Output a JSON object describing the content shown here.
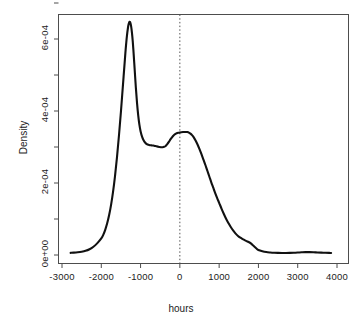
{
  "figure": {
    "background_color": "#ffffff",
    "line_color": "#111111",
    "axis_color": "#4d4d4d"
  },
  "chart_data": {
    "type": "line",
    "title": "",
    "subtitle": "",
    "xlabel": "hours",
    "ylabel": "Density",
    "xlim": [
      -3000,
      4000
    ],
    "ylim": [
      0,
      0.00072
    ],
    "grid": false,
    "legend": null,
    "x_ticks": [
      -3000,
      -2000,
      -1000,
      0,
      1000,
      2000,
      3000,
      4000
    ],
    "x_tick_labels": [
      "-3000",
      "-2000",
      "-1000",
      "0",
      "1000",
      "2000",
      "3000",
      "4000"
    ],
    "y_ticks": [
      0,
      0.0001,
      0.0002,
      0.0003,
      0.0004,
      0.0005,
      0.0006,
      0.0007
    ],
    "y_tick_labels": [
      "0e+00",
      "",
      "2e-04",
      "",
      "4e-04",
      "",
      "6e-04",
      ""
    ],
    "y_labeled_ticks": [
      {
        "value": 0,
        "label": "0e+00"
      },
      {
        "value": 0.0002,
        "label": "2e-04"
      },
      {
        "value": 0.0004,
        "label": "4e-04"
      },
      {
        "value": 0.0006,
        "label": "6e-04"
      }
    ],
    "annotations": [
      {
        "type": "vline",
        "x": 0,
        "style": "dotted",
        "color": "#555555"
      }
    ],
    "series": [
      {
        "name": "density",
        "x": [
          -2780,
          -2700,
          -2600,
          -2500,
          -2400,
          -2300,
          -2200,
          -2100,
          -2000,
          -1950,
          -1900,
          -1850,
          -1800,
          -1750,
          -1700,
          -1650,
          -1600,
          -1550,
          -1500,
          -1450,
          -1400,
          -1380,
          -1350,
          -1320,
          -1300,
          -1280,
          -1260,
          -1240,
          -1220,
          -1200,
          -1180,
          -1150,
          -1120,
          -1090,
          -1060,
          -1030,
          -1000,
          -960,
          -920,
          -880,
          -840,
          -800,
          -760,
          -720,
          -680,
          -640,
          -600,
          -560,
          -520,
          -480,
          -440,
          -400,
          -360,
          -320,
          -280,
          -240,
          -200,
          -160,
          -120,
          -80,
          -40,
          0,
          40,
          80,
          120,
          160,
          190,
          230,
          270,
          310,
          350,
          400,
          450,
          500,
          550,
          600,
          650,
          700,
          750,
          800,
          850,
          900,
          950,
          1000,
          1060,
          1120,
          1180,
          1240,
          1300,
          1360,
          1420,
          1480,
          1540,
          1600,
          1660,
          1700,
          1750,
          1800,
          1850,
          1900,
          1950,
          2000,
          2100,
          2200,
          2300,
          2400,
          2500,
          2600,
          2700,
          2800,
          2900,
          3000,
          3100,
          3200,
          3300,
          3400,
          3500,
          3600,
          3700,
          3800,
          3850
        ],
        "y": [
          6e-06,
          6.5e-06,
          7.5e-06,
          9e-06,
          1.15e-05,
          1.6e-05,
          2.3e-05,
          3.3e-05,
          4.6e-05,
          5.6e-05,
          7e-05,
          8.8e-05,
          0.000111,
          0.00014,
          0.000176,
          0.00022,
          0.000272,
          0.000332,
          0.000398,
          0.00047,
          0.000542,
          0.00057,
          0.000606,
          0.000632,
          0.000643,
          0.000648,
          0.000645,
          0.000635,
          0.000618,
          0.000595,
          0.000565,
          0.000515,
          0.000465,
          0.000422,
          0.000388,
          0.000362,
          0.000344,
          0.000328,
          0.000318,
          0.000312,
          0.000308,
          0.000306,
          0.000305,
          0.0003045,
          0.000304,
          0.000303,
          0.000302,
          0.000301,
          0.0003,
          0.0002995,
          0.0002995,
          0.0003005,
          0.000303,
          0.000308,
          0.000314,
          0.000321,
          0.000327,
          0.000332,
          0.0003355,
          0.000338,
          0.0003395,
          0.0003405,
          0.0003412,
          0.0003416,
          0.0003418,
          0.0003418,
          0.0003415,
          0.00034,
          0.000337,
          0.000333,
          0.0003275,
          0.000318,
          0.000307,
          0.000294,
          0.00028,
          0.000265,
          0.00025,
          0.000234,
          0.000218,
          0.000202,
          0.000187,
          0.000172,
          0.000158,
          0.000145,
          0.000129,
          0.000114,
          0.0001,
          8.8e-05,
          7.7e-05,
          6.75e-05,
          5.95e-05,
          5.3e-05,
          4.8e-05,
          4.4e-05,
          4.05e-05,
          3.85e-05,
          3.6e-05,
          3.3e-05,
          2.8e-05,
          2.3e-05,
          1.8e-05,
          1.4e-05,
          1.05e-05,
          8.2e-06,
          7e-06,
          6.2e-06,
          5.8e-06,
          5.6e-06,
          5.6e-06,
          5.8e-06,
          6.2e-06,
          6.8e-06,
          7.5e-06,
          8e-06,
          8e-06,
          7.6e-06,
          7e-06,
          6.5e-06,
          6.1e-06,
          5.8e-06,
          5.7e-06
        ],
        "peaks": [
          {
            "x": -1280,
            "y": 0.000648,
            "label": "primary mode"
          },
          {
            "x": 190,
            "y": 0.000342,
            "label": "secondary mode"
          }
        ],
        "local_minimum": {
          "x": -460,
          "y": 0.0003
        }
      }
    ]
  }
}
